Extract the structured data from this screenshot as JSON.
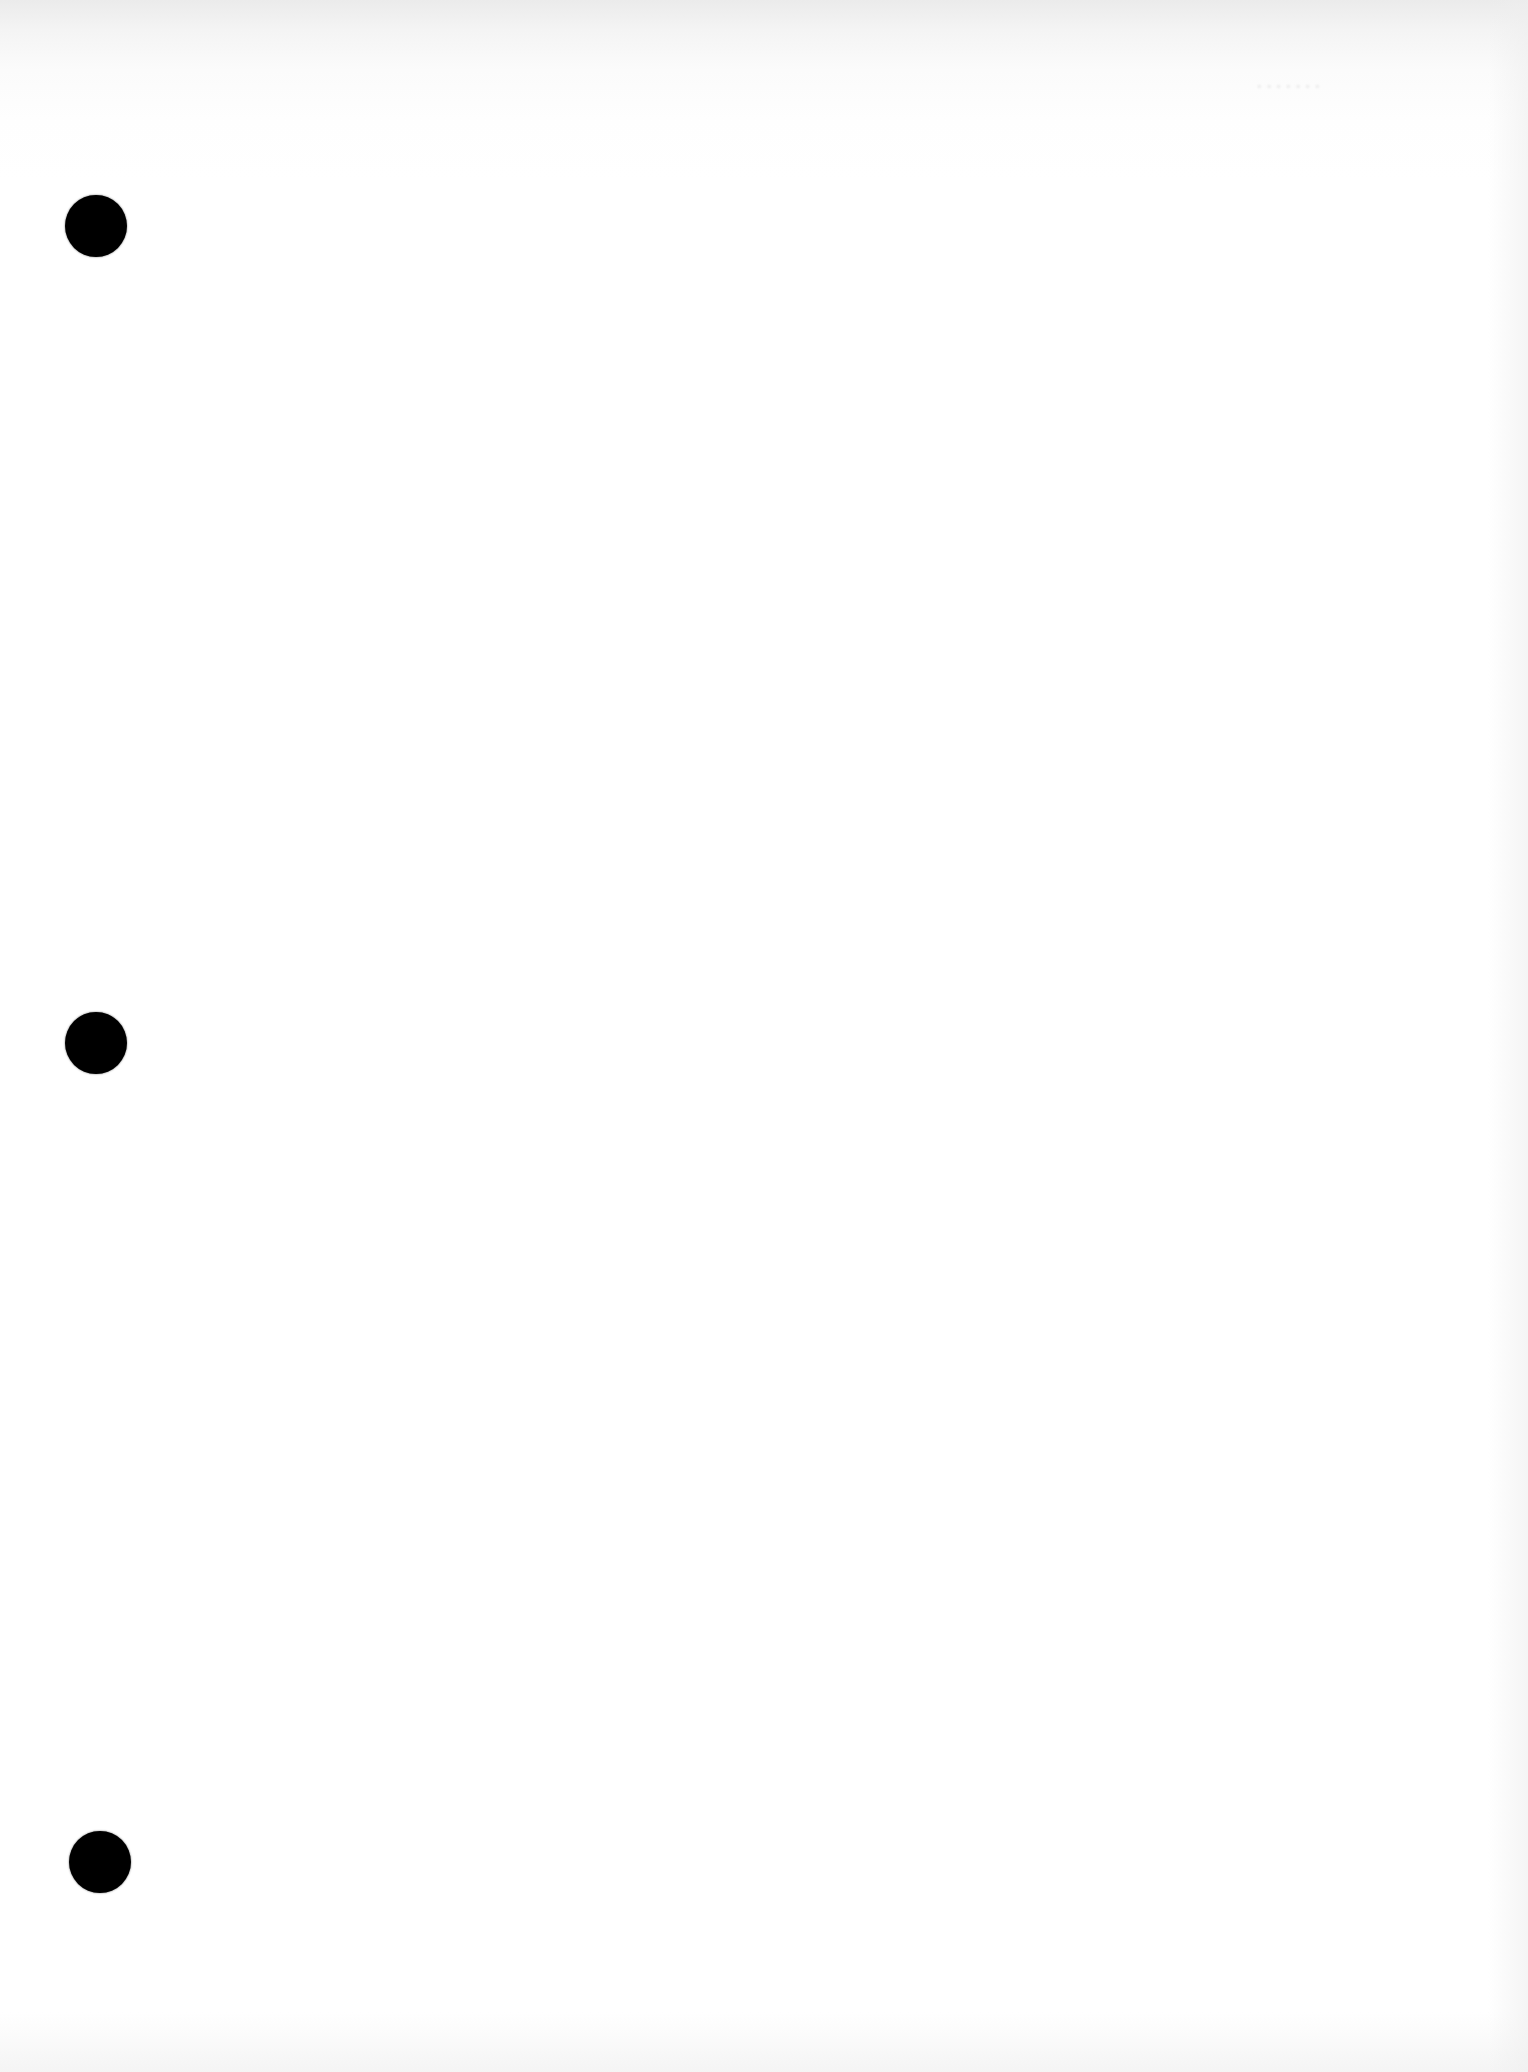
{
  "document": {
    "type": "blank-page",
    "bleed_through_text": "·······",
    "punch_holes": [
      {
        "id": "top",
        "cx": 96,
        "cy": 226
      },
      {
        "id": "middle",
        "cx": 96,
        "cy": 1043
      },
      {
        "id": "bottom",
        "cx": 100,
        "cy": 1862
      }
    ],
    "colors": {
      "paper": "#ffffff",
      "hole": "#000000",
      "top_shading": "#ebebeb"
    }
  }
}
